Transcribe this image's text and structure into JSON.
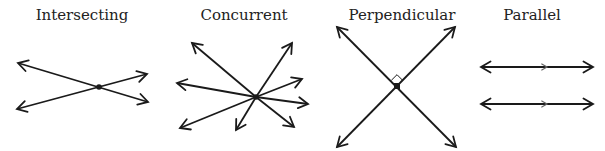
{
  "colors": {
    "line": "#1a1a1a",
    "background": "#ffffff",
    "midArrow": "#666666"
  },
  "diagrams": [
    {
      "title": "Intersecting",
      "title_x": 82,
      "point": [
        99,
        87
      ],
      "lines": [
        {
          "from": [
            18,
            63
          ],
          "to": [
            148,
            102
          ],
          "arrowStart": true,
          "arrowEnd": true
        },
        {
          "from": [
            17,
            109
          ],
          "to": [
            147,
            74
          ],
          "arrowStart": true,
          "arrowEnd": true
        }
      ]
    },
    {
      "title": "Concurrent",
      "title_x": 244,
      "point": [
        256,
        97
      ],
      "rays": [
        [
          192,
          43
        ],
        [
          292,
          43
        ],
        [
          177,
          83
        ],
        [
          302,
          79
        ],
        [
          308,
          104
        ],
        [
          180,
          128
        ],
        [
          236,
          130
        ],
        [
          294,
          127
        ]
      ]
    },
    {
      "title": "Perpendicular",
      "title_x": 402,
      "point": [
        397,
        86
      ],
      "lines": [
        {
          "from": [
            337,
            27
          ],
          "to": [
            456,
            147
          ],
          "arrowStart": true,
          "arrowEnd": true
        },
        {
          "from": [
            455,
            27
          ],
          "to": [
            337,
            147
          ],
          "arrowStart": true,
          "arrowEnd": true
        }
      ],
      "rightAngleMarker": true
    },
    {
      "title": "Parallel",
      "title_x": 532,
      "lines": [
        {
          "from": [
            481,
            67
          ],
          "to": [
            593,
            67
          ],
          "arrowStart": true,
          "arrowEnd": true,
          "midArrowX": 547
        },
        {
          "from": [
            481,
            104
          ],
          "to": [
            593,
            104
          ],
          "arrowStart": true,
          "arrowEnd": true,
          "midArrowX": 547
        }
      ]
    }
  ]
}
